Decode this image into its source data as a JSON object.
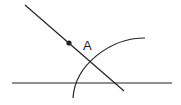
{
  "diagram": {
    "type": "geometry-construction",
    "colors": {
      "stroke": "#222222",
      "background": "#ffffff"
    },
    "point_label": "A",
    "elements": {
      "diagonal_line": {
        "x1": 25,
        "y1": 5,
        "x2": 124,
        "y2": 91
      },
      "horizontal_line": {
        "x1": 12,
        "y1": 83,
        "x2": 172,
        "y2": 83
      },
      "arc": {
        "d": "M145 38 C 110 38, 75 65, 73 98"
      },
      "point": {
        "cx": 69,
        "cy": 43,
        "r": 2.6
      },
      "label_pos": {
        "x": 83,
        "y": 50
      }
    }
  }
}
